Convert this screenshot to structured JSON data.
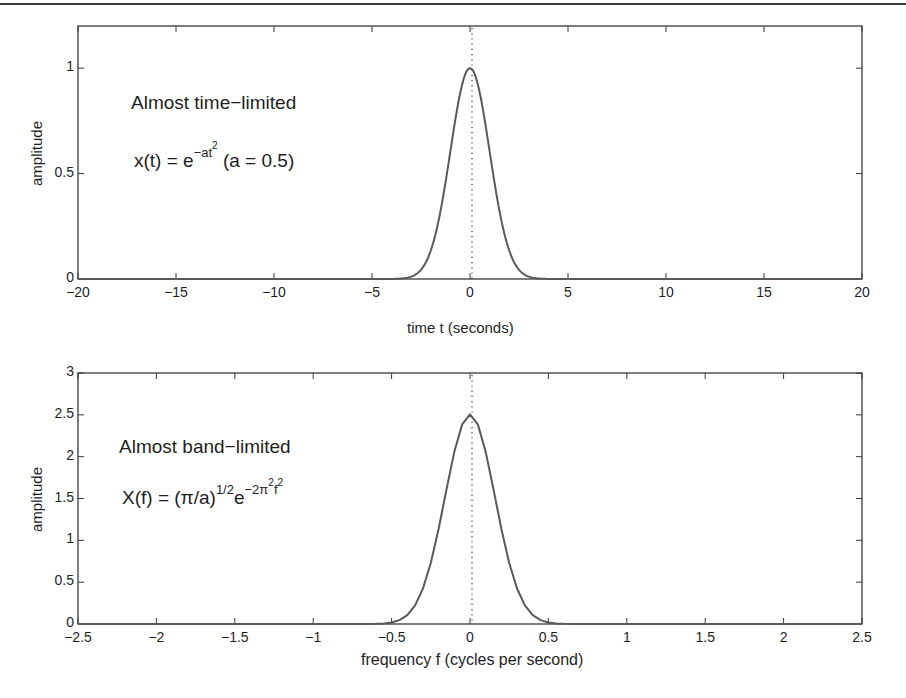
{
  "chart_data": [
    {
      "type": "line",
      "title": "",
      "xlabel": "time t (seconds)",
      "ylabel": "amplitude",
      "xlim": [
        -20,
        20
      ],
      "ylim": [
        0,
        1.2
      ],
      "xticks": [
        -20,
        -15,
        -10,
        -5,
        0,
        5,
        10,
        15,
        20
      ],
      "yticks": [
        0,
        0.5,
        1
      ],
      "xtick_labels": [
        "−20",
        "−15",
        "−10",
        "−5",
        "0",
        "5",
        "10",
        "15",
        "20"
      ],
      "ytick_labels": [
        "0",
        "0.5",
        "1"
      ],
      "grid": false,
      "annotations": [
        "Almost time−limited",
        "x(t) = e^{−at^2} (a = 0.5)"
      ],
      "reference_line": {
        "x": 0,
        "style": "dotted"
      },
      "series": [
        {
          "name": "x(t) = exp(-0.5 t^2)",
          "x": [
            -20,
            -5,
            -4,
            -3.5,
            -3,
            -2.5,
            -2,
            -1.75,
            -1.5,
            -1.25,
            -1,
            -0.75,
            -0.5,
            -0.25,
            0,
            0.25,
            0.5,
            0.75,
            1,
            1.25,
            1.5,
            1.75,
            2,
            2.5,
            3,
            3.5,
            4,
            5,
            20
          ],
          "y": [
            0,
            0,
            0.0003,
            0.0022,
            0.0111,
            0.0439,
            0.1353,
            0.2163,
            0.3247,
            0.4578,
            0.6065,
            0.7548,
            0.8825,
            0.9692,
            1.0,
            0.9692,
            0.8825,
            0.7548,
            0.6065,
            0.4578,
            0.3247,
            0.2163,
            0.1353,
            0.0439,
            0.0111,
            0.0022,
            0.0003,
            0,
            0
          ]
        }
      ]
    },
    {
      "type": "line",
      "title": "",
      "xlabel": "frequency f (cycles per second)",
      "ylabel": "amplitude",
      "xlim": [
        -2.5,
        2.5
      ],
      "ylim": [
        0,
        3
      ],
      "xticks": [
        -2.5,
        -2,
        -1.5,
        -1,
        -0.5,
        0,
        0.5,
        1,
        1.5,
        2,
        2.5
      ],
      "yticks": [
        0,
        0.5,
        1,
        1.5,
        2,
        2.5,
        3
      ],
      "xtick_labels": [
        "−2.5",
        "−2",
        "−1.5",
        "−1",
        "−0.5",
        "0",
        "0.5",
        "1",
        "1.5",
        "2",
        "2.5"
      ],
      "ytick_labels": [
        "0",
        "0.5",
        "1",
        "1.5",
        "2",
        "2.5",
        "3"
      ],
      "grid": false,
      "annotations": [
        "Almost band−limited",
        "X(f) = (π/a)^{1/2} e^{−2π^2 f^2}"
      ],
      "reference_line": {
        "x": 0,
        "style": "dotted"
      },
      "series": [
        {
          "name": "X(f) = sqrt(pi/a) exp(-2 pi^2 f^2)",
          "x": [
            -2.5,
            -0.7,
            -0.6,
            -0.5,
            -0.4,
            -0.3,
            -0.2,
            -0.1,
            -0.05,
            0,
            0.05,
            0.1,
            0.2,
            0.3,
            0.4,
            0.5,
            0.6,
            0.7,
            2.5
          ],
          "y": [
            0,
            0.0016,
            0.0204,
            0.1749,
            0.1004,
            0.4213,
            1.1398,
            2.0541,
            2.4131,
            2.5066,
            2.4131,
            2.0541,
            1.1398,
            0.4213,
            0.1004,
            0.1749,
            0.0204,
            0.0016,
            0
          ]
        }
      ]
    }
  ],
  "plots": {
    "top": {
      "ylabel": "amplitude",
      "xlabel": "time t (seconds)",
      "annot_title": "Almost time−limited",
      "formula_base": "x(t) = e",
      "formula_exp": "−at",
      "formula_exp_sup": "2",
      "formula_tail": " (a = 0.5)"
    },
    "bottom": {
      "ylabel": "amplitude",
      "xlabel": "frequency f (cycles per second)",
      "annot_title": "Almost band−limited",
      "formula_base": "X(f) = (π/a)",
      "formula_exp1": "1/2",
      "formula_e": "e",
      "formula_exp2": "−2π",
      "formula_exp2_sup": "2",
      "formula_exp2_f": "f",
      "formula_exp2_f_sup": "2"
    }
  },
  "colors": {
    "curve": "#5a5a5a",
    "axes": "#3a3a3a",
    "text": "#1e1e1e"
  }
}
